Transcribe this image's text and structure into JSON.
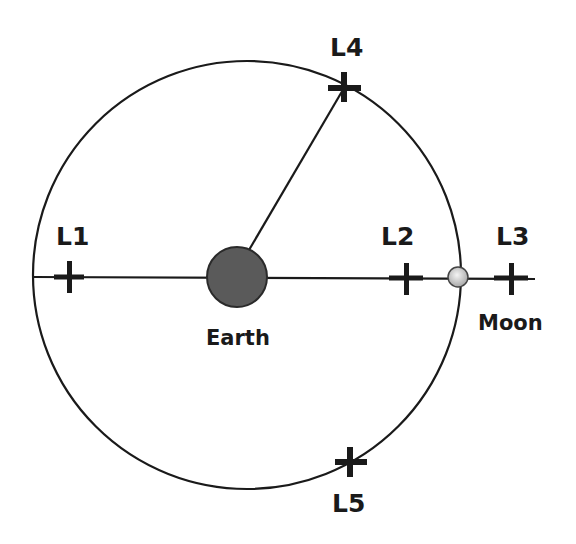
{
  "diagram": {
    "colors": {
      "line": "#1a1a1a",
      "earth": "#5a5a5a",
      "moon": "#d8d8d8",
      "background": "#ffffff"
    },
    "earth": {
      "label": "Earth",
      "cx": 237,
      "cy": 277,
      "r": 30
    },
    "moon": {
      "label": "Moon",
      "cx": 458,
      "cy": 277,
      "r": 10
    },
    "orbit": {
      "cx": 247,
      "cy": 275,
      "r": 214
    },
    "points": [
      {
        "id": "L1",
        "label": "L1",
        "x": 69,
        "y": 277,
        "label_x": 56,
        "label_y": 245
      },
      {
        "id": "L2",
        "label": "L2",
        "x": 406,
        "y": 278,
        "label_x": 381,
        "label_y": 245
      },
      {
        "id": "L3",
        "label": "L3",
        "x": 511,
        "y": 278,
        "label_x": 496,
        "label_y": 245
      },
      {
        "id": "L4",
        "label": "L4",
        "x": 344,
        "y": 88,
        "label_x": 330,
        "label_y": 56
      },
      {
        "id": "L5",
        "label": "L5",
        "x": 350,
        "y": 462,
        "label_x": 332,
        "label_y": 512
      }
    ],
    "moon_label": {
      "text": "Moon",
      "x": 478,
      "y": 330
    },
    "earth_label": {
      "text": "Earth",
      "x": 206,
      "y": 345
    }
  }
}
